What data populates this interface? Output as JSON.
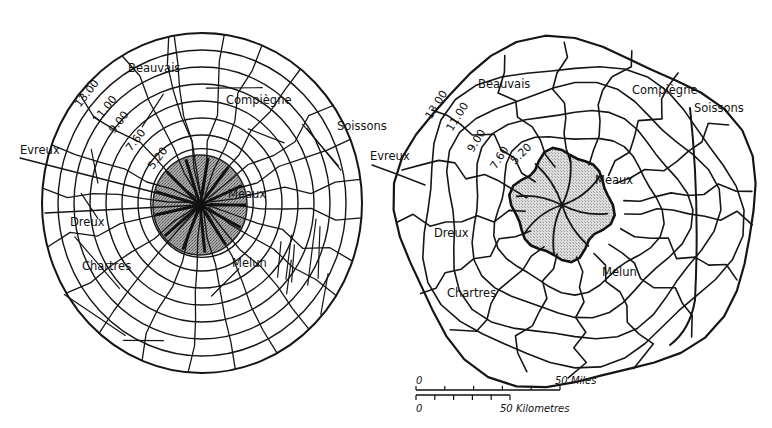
{
  "figure": {
    "colors": {
      "ink": "#151515",
      "background": "#ffffff",
      "core_fill_left": "#9a9a9a",
      "core_fill_right": "#d2d2d2"
    }
  },
  "left_map": {
    "title": "Idealised concentric model",
    "ring_labels": [
      "13.00",
      "11.00",
      "9.00",
      "7.60",
      "5.20"
    ],
    "towns": [
      {
        "id": "beauvais",
        "label": "Beauvais"
      },
      {
        "id": "compiegne",
        "label": "Compiègne"
      },
      {
        "id": "soissons",
        "label": "Soissons"
      },
      {
        "id": "evreux",
        "label": "Evreux"
      },
      {
        "id": "meaux",
        "label": "Meaux"
      },
      {
        "id": "dreux",
        "label": "Dreux"
      },
      {
        "id": "chartres",
        "label": "Chartres"
      },
      {
        "id": "melun",
        "label": "Melun"
      }
    ]
  },
  "right_map": {
    "title": "Actual road network",
    "ring_labels": [
      "13.00",
      "11.00",
      "9.00",
      "7.60",
      "5.20"
    ],
    "towns": [
      {
        "id": "beauvais",
        "label": "Beauvais"
      },
      {
        "id": "compiegne",
        "label": "Compiègne"
      },
      {
        "id": "soissons",
        "label": "Soissons"
      },
      {
        "id": "evreux",
        "label": "Evreux"
      },
      {
        "id": "meaux",
        "label": "Meaux"
      },
      {
        "id": "dreux",
        "label": "Dreux"
      },
      {
        "id": "chartres",
        "label": "Chartres"
      },
      {
        "id": "melun",
        "label": "Melun"
      }
    ]
  },
  "scale_bar": {
    "miles": {
      "start_label": "0",
      "end_label": "50 Miles",
      "divisions": 5
    },
    "kilometres": {
      "start_label": "0",
      "end_label": "50 Kilometres",
      "divisions": 5
    }
  }
}
